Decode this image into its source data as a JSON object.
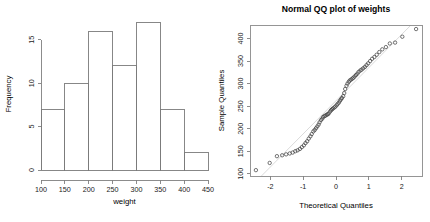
{
  "figure": {
    "background_color": "#ffffff",
    "axis_color": "#808080",
    "point_color": "#3a3a3a",
    "refline_color": "#d6d6d6",
    "panel_count": 2
  },
  "chart_data": [
    {
      "type": "bar",
      "subtype": "histogram",
      "title": "",
      "xlabel": "weight",
      "ylabel": "Frequency",
      "categories": [
        "100-150",
        "150-200",
        "200-250",
        "250-300",
        "300-350",
        "350-400",
        "400-450"
      ],
      "bin_edges": [
        100,
        150,
        200,
        250,
        300,
        350,
        400,
        450
      ],
      "values": [
        7,
        10,
        16,
        12,
        17,
        7,
        2
      ],
      "xticks": [
        100,
        150,
        200,
        250,
        300,
        350,
        400,
        450
      ],
      "xtick_labels": [
        "100",
        "150",
        "200",
        "250",
        "300",
        "350",
        "400",
        "450"
      ],
      "yticks": [
        0,
        5,
        10,
        15
      ],
      "ytick_labels": [
        "0",
        "5",
        "10",
        "15"
      ],
      "xlim": [
        100,
        450
      ],
      "ylim": [
        0,
        17.5
      ],
      "grid": false,
      "legend": false,
      "bar_fill": "none",
      "bar_stroke": "#7a7a7a"
    },
    {
      "type": "scatter",
      "subtype": "qq-plot",
      "title": "Normal QQ plot of weights",
      "xlabel": "Theoretical Quantiles",
      "ylabel": "Sample Quantiles",
      "xticks": [
        -2,
        -1,
        0,
        1,
        2
      ],
      "xtick_labels": [
        "-2",
        "-1",
        "0",
        "1",
        "2"
      ],
      "yticks": [
        100,
        150,
        200,
        250,
        300,
        350,
        400
      ],
      "ytick_labels": [
        "100",
        "150",
        "200",
        "250",
        "300",
        "350",
        "400"
      ],
      "xlim": [
        -2.62,
        2.62
      ],
      "ylim": [
        95,
        430
      ],
      "grid": false,
      "legend": false,
      "reference_line": {
        "slope": 73.5,
        "intercept": 262.0,
        "color": "#d6d6d6"
      },
      "x": [
        -2.44,
        -2.02,
        -1.8,
        -1.64,
        -1.52,
        -1.41,
        -1.32,
        -1.24,
        -1.17,
        -1.1,
        -1.04,
        -0.98,
        -0.93,
        -0.88,
        -0.83,
        -0.78,
        -0.74,
        -0.69,
        -0.65,
        -0.61,
        -0.57,
        -0.53,
        -0.5,
        -0.46,
        -0.42,
        -0.39,
        -0.35,
        -0.32,
        -0.28,
        -0.25,
        -0.22,
        -0.18,
        -0.15,
        -0.12,
        -0.09,
        -0.05,
        -0.02,
        0.02,
        0.05,
        0.09,
        0.12,
        0.15,
        0.18,
        0.22,
        0.25,
        0.28,
        0.32,
        0.35,
        0.39,
        0.42,
        0.46,
        0.5,
        0.53,
        0.57,
        0.61,
        0.65,
        0.69,
        0.74,
        0.78,
        0.83,
        0.88,
        0.93,
        0.98,
        1.04,
        1.1,
        1.17,
        1.24,
        1.32,
        1.41,
        1.52,
        1.64,
        1.8,
        2.02,
        2.44
      ],
      "y": [
        108,
        124,
        139,
        141,
        143,
        145,
        147,
        150,
        152,
        155,
        159,
        163,
        168,
        172,
        178,
        183,
        188,
        194,
        197,
        201,
        205,
        209,
        214,
        219,
        222,
        226,
        228,
        229,
        231,
        232,
        234,
        238,
        241,
        243,
        245,
        247,
        249,
        252,
        255,
        258,
        262,
        265,
        268,
        272,
        279,
        288,
        295,
        300,
        304,
        307,
        309,
        311,
        313,
        316,
        319,
        322,
        326,
        329,
        331,
        334,
        337,
        341,
        345,
        350,
        355,
        359,
        364,
        370,
        376,
        381,
        389,
        391,
        404,
        421
      ]
    }
  ]
}
